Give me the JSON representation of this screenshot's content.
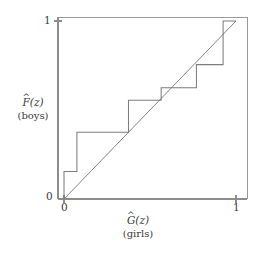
{
  "figure": {
    "name": "pp-plot-boys-girls",
    "background_color": "#ffffff",
    "line_color": "#7d7d7d",
    "axis_color": "#8d8d8d",
    "text_color": "#3a3a3a"
  },
  "axes": {
    "y": {
      "title_symbol": "F",
      "title_hat": "^",
      "title_arg": "(z)",
      "title_sub": "(boys)",
      "ticks": [
        {
          "value": 0,
          "label": "0"
        },
        {
          "value": 1,
          "label": "1"
        }
      ]
    },
    "x": {
      "title_symbol": "G",
      "title_hat": "^",
      "title_arg": "(z)",
      "title_sub": "(girls)",
      "ticks": [
        {
          "value": 0,
          "label": "0"
        },
        {
          "value": 1,
          "label": "1"
        }
      ]
    }
  },
  "chart_data": {
    "type": "line",
    "title": "",
    "xlabel": "Ĝ(z) (girls)",
    "ylabel": "F̂(z) (boys)",
    "xlim": [
      0,
      1
    ],
    "ylim": [
      0,
      1
    ],
    "grid": false,
    "legend": "none",
    "series": [
      {
        "name": "empirical-step",
        "type": "step",
        "drawstyle": "steps-post",
        "x": [
          0.0,
          0.0,
          0.075,
          0.075,
          0.375,
          0.375,
          0.565,
          0.565,
          0.77,
          0.77,
          0.925,
          0.925,
          1.0
        ],
        "y": [
          0.0,
          0.155,
          0.155,
          0.375,
          0.375,
          0.555,
          0.555,
          0.625,
          0.625,
          0.755,
          0.755,
          1.0,
          1.0
        ]
      },
      {
        "name": "reference-diagonal",
        "type": "line",
        "x": [
          0.0,
          1.0
        ],
        "y": [
          0.0,
          1.0
        ]
      }
    ]
  }
}
